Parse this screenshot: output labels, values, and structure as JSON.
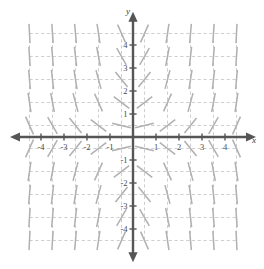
{
  "figure": {
    "kind": "slope-field",
    "x_axis_label": "x",
    "y_axis_label": "y",
    "background_color": "#ffffff",
    "axis_color": "#555555",
    "grid_color": "#c9c9c9",
    "segment_color": "#b0b0b0",
    "tick_label_color": "#4a4a4a"
  },
  "x_ticks": [
    {
      "value": -4,
      "label": "-4"
    },
    {
      "value": -3,
      "label": "-3"
    },
    {
      "value": -2,
      "label": "-2"
    },
    {
      "value": -1,
      "label": "-1"
    },
    {
      "value": 1,
      "label": "1"
    },
    {
      "value": 2,
      "label": "2"
    },
    {
      "value": 3,
      "label": "3"
    },
    {
      "value": 4,
      "label": "4"
    }
  ],
  "y_ticks": [
    {
      "value": 4,
      "label": "4"
    },
    {
      "value": 3,
      "label": "3"
    },
    {
      "value": 2,
      "label": "2"
    },
    {
      "value": 1,
      "label": "1"
    },
    {
      "value": -1,
      "label": "-1"
    },
    {
      "value": -2,
      "label": "-2"
    },
    {
      "value": -3,
      "label": "-3"
    },
    {
      "value": -4,
      "label": "-4"
    }
  ],
  "chart_data": {
    "type": "scatter",
    "title": "",
    "xlabel": "x",
    "ylabel": "y",
    "xlim": [
      -4.6,
      4.6
    ],
    "ylim": [
      -4.6,
      4.6
    ],
    "grid": true,
    "grid_style": "dashed",
    "legend": "none",
    "field_equation": "dy/dx = x*y",
    "sample_points_x": [
      -4.5,
      -3.5,
      -2.5,
      -1.5,
      -0.5,
      0.5,
      1.5,
      2.5,
      3.5,
      4.5
    ],
    "sample_points_y": [
      4.5,
      3.5,
      2.5,
      1.5,
      0.5,
      -0.5,
      -1.5,
      -2.5,
      -3.5,
      -4.5
    ],
    "segment_half_length": 0.42
  }
}
